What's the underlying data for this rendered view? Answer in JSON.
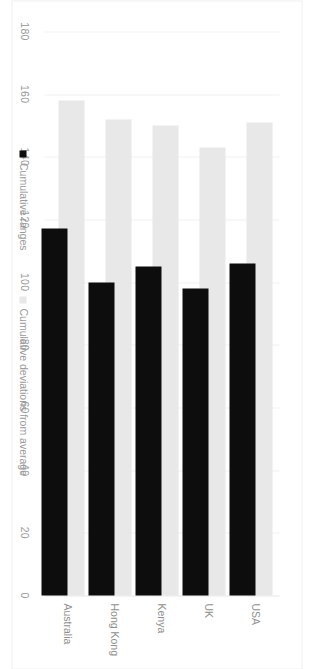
{
  "chart_data": {
    "type": "bar",
    "orientation": "horizontal",
    "title": "",
    "xlabel": "",
    "ylabel": "",
    "categories": [
      "Australia",
      "Hong Kong",
      "Kenya",
      "UK",
      "USA"
    ],
    "series": [
      {
        "name": "Cumulative ranges",
        "color": "#0d0d0d",
        "values": [
          117,
          100,
          105,
          98,
          106
        ]
      },
      {
        "name": "Cumulative deviations from average",
        "color": "#e8e8e8",
        "values": [
          158,
          152,
          150,
          143,
          151
        ]
      }
    ],
    "xlim": [
      0,
      180
    ],
    "xticks": [
      180,
      160,
      140,
      120,
      100,
      80,
      60,
      40,
      20,
      0
    ],
    "tick_labels": [
      "180",
      "160",
      "140",
      "120",
      "100",
      "80",
      "60",
      "40",
      "20",
      "0"
    ],
    "grid": true,
    "grid_color": "#f2f2f2",
    "legend_position": "bottom",
    "axis_direction": "reversed",
    "background": "#ffffff",
    "rotation_degrees": 90
  },
  "legend": {
    "items": [
      {
        "label": "Cumulative ranges",
        "swatch": "black-square"
      },
      {
        "label": "Cumulative deviations from average",
        "swatch": "gray-square"
      }
    ]
  },
  "axis": {
    "ticks": [
      "180",
      "160",
      "140",
      "120",
      "100",
      "80",
      "60",
      "40",
      "20",
      "0"
    ]
  },
  "categories": [
    {
      "label": "Australia"
    },
    {
      "label": "Hong Kong"
    },
    {
      "label": "Kenya"
    },
    {
      "label": "UK"
    },
    {
      "label": "USA"
    }
  ]
}
